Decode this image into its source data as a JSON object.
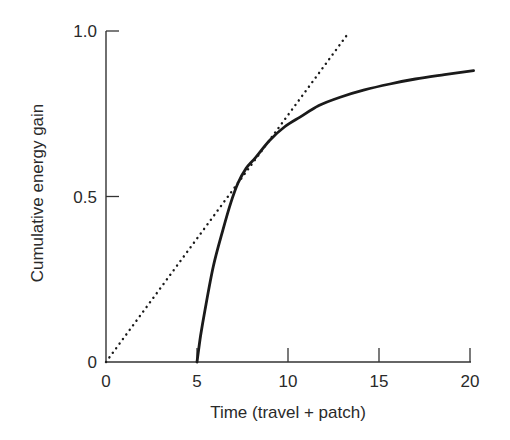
{
  "chart_data": {
    "type": "line",
    "title": "",
    "xlabel": "Time (travel + patch)",
    "ylabel": "Cumulative energy gain",
    "xlim": [
      0,
      20
    ],
    "ylim": [
      0,
      1.0
    ],
    "grid": false,
    "legend": null,
    "x_ticks": [
      {
        "value": 0,
        "label": "0"
      },
      {
        "value": 5,
        "label": "5"
      },
      {
        "value": 10,
        "label": "10"
      },
      {
        "value": 15,
        "label": "15"
      },
      {
        "value": 20,
        "label": "20"
      }
    ],
    "y_ticks": [
      {
        "value": 0,
        "label": "0"
      },
      {
        "value": 0.5,
        "label": "0.5"
      },
      {
        "value": 1.0,
        "label": "1.0"
      }
    ],
    "series": [
      {
        "name": "Gain curve",
        "style": "solid",
        "color": "#1a1a1a",
        "x": [
          5.0,
          5.2,
          5.44,
          5.9,
          6.43,
          6.85,
          7.25,
          7.7,
          8.19,
          9.0,
          9.8,
          10.66,
          11.7,
          12.86,
          14.2,
          15.6,
          17.0,
          18.6,
          20.2
        ],
        "y": [
          0.0,
          0.08,
          0.157,
          0.29,
          0.4,
          0.48,
          0.54,
          0.585,
          0.616,
          0.67,
          0.71,
          0.74,
          0.775,
          0.8,
          0.822,
          0.84,
          0.855,
          0.868,
          0.88
        ]
      },
      {
        "name": "Tangent line",
        "style": "dotted",
        "color": "#1a1a1a",
        "x": [
          0,
          13.24
        ],
        "y": [
          0,
          0.988
        ]
      }
    ]
  }
}
